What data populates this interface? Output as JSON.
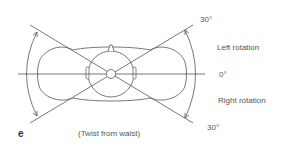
{
  "figure": {
    "panel_letter": "e",
    "caption": "(Twist from waist)",
    "labels": {
      "top_angle": "30°",
      "left_rotation": "Left rotation",
      "zero_angle": "0°",
      "right_rotation": "Right rotation",
      "bottom_angle": "30°"
    },
    "colors": {
      "line": "#555555",
      "text": "#555555",
      "background": "#ffffff"
    }
  }
}
